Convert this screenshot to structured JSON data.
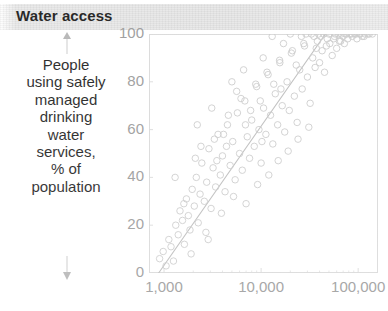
{
  "header": {
    "title": "Water access",
    "band_color": "#e8e8e8"
  },
  "axis_caption": {
    "lines": [
      "People",
      "using safely",
      "managed",
      "drinking",
      "water",
      "services,",
      "% of",
      "population"
    ],
    "arrow_up": "arrow-up-icon",
    "arrow_down": "arrow-down-icon"
  },
  "chart_data": {
    "type": "scatter",
    "title": "Water access",
    "xlabel": "",
    "ylabel": "People using safely managed drinking water services, % of population",
    "x_scale": "log",
    "xlim": [
      700,
      160000
    ],
    "ylim": [
      0,
      100
    ],
    "grid": false,
    "legend": null,
    "xticks": [
      1000,
      10000,
      100000
    ],
    "xtick_labels": [
      "1,000",
      "10,000",
      "100,000"
    ],
    "yticks": [
      0,
      20,
      40,
      60,
      80,
      100
    ],
    "ytick_labels": [
      "0",
      "20",
      "40",
      "60",
      "80",
      "100"
    ],
    "marker": {
      "shape": "circle",
      "fill": "none",
      "edge_color": "#c9c9c9",
      "size": 6.5
    },
    "trendline": {
      "type": "linear-on-log-x",
      "color": "#bdbdbd",
      "x0": 880,
      "y0": 0,
      "x1": 46000,
      "y1": 100
    },
    "points": [
      [
        900,
        6
      ],
      [
        980,
        9
      ],
      [
        1050,
        3
      ],
      [
        1120,
        14
      ],
      [
        1180,
        11
      ],
      [
        1250,
        5
      ],
      [
        1320,
        20
      ],
      [
        1400,
        16
      ],
      [
        1460,
        26
      ],
      [
        1550,
        22
      ],
      [
        1620,
        12
      ],
      [
        1700,
        31
      ],
      [
        1780,
        24
      ],
      [
        1850,
        18
      ],
      [
        1950,
        35
      ],
      [
        2050,
        28
      ],
      [
        2150,
        40
      ],
      [
        2250,
        21
      ],
      [
        2350,
        33
      ],
      [
        2450,
        46
      ],
      [
        2600,
        30
      ],
      [
        2750,
        38
      ],
      [
        2900,
        52
      ],
      [
        3050,
        27
      ],
      [
        3200,
        44
      ],
      [
        3400,
        36
      ],
      [
        3600,
        58
      ],
      [
        3800,
        41
      ],
      [
        4000,
        49
      ],
      [
        4250,
        34
      ],
      [
        4500,
        62
      ],
      [
        4800,
        45
      ],
      [
        5100,
        55
      ],
      [
        5400,
        39
      ],
      [
        5700,
        67
      ],
      [
        6000,
        50
      ],
      [
        6400,
        43
      ],
      [
        6800,
        72
      ],
      [
        7200,
        57
      ],
      [
        7600,
        48
      ],
      [
        8000,
        64
      ],
      [
        8500,
        53
      ],
      [
        9000,
        78
      ],
      [
        9500,
        60
      ],
      [
        10000,
        46
      ],
      [
        10600,
        69
      ],
      [
        11200,
        58
      ],
      [
        11800,
        83
      ],
      [
        12500,
        66
      ],
      [
        13200,
        54
      ],
      [
        14000,
        75
      ],
      [
        14800,
        62
      ],
      [
        15600,
        88
      ],
      [
        16500,
        70
      ],
      [
        17500,
        59
      ],
      [
        18500,
        80
      ],
      [
        19500,
        68
      ],
      [
        20500,
        92
      ],
      [
        22000,
        74
      ],
      [
        23500,
        63
      ],
      [
        25000,
        85
      ],
      [
        26500,
        77
      ],
      [
        28000,
        95
      ],
      [
        30000,
        82
      ],
      [
        32000,
        71
      ],
      [
        34000,
        90
      ],
      [
        36000,
        86
      ],
      [
        38000,
        97
      ],
      [
        40000,
        88
      ],
      [
        42500,
        93
      ],
      [
        45000,
        84
      ],
      [
        48000,
        98
      ],
      [
        51000,
        96
      ],
      [
        54000,
        91
      ],
      [
        57000,
        99
      ],
      [
        60000,
        94
      ],
      [
        63000,
        100
      ],
      [
        66000,
        97
      ],
      [
        70000,
        99
      ],
      [
        74000,
        100
      ],
      [
        78000,
        98
      ],
      [
        82000,
        100
      ],
      [
        87000,
        99
      ],
      [
        92000,
        100
      ],
      [
        97000,
        98
      ],
      [
        103000,
        100
      ],
      [
        110000,
        99
      ],
      [
        118000,
        100
      ],
      [
        126000,
        100
      ],
      [
        1900,
        8
      ],
      [
        2700,
        17
      ],
      [
        3900,
        25
      ],
      [
        5200,
        32
      ],
      [
        7000,
        29
      ],
      [
        9200,
        37
      ],
      [
        12000,
        41
      ],
      [
        15000,
        47
      ],
      [
        19000,
        51
      ],
      [
        24000,
        56
      ],
      [
        31000,
        61
      ],
      [
        1300,
        40
      ],
      [
        2100,
        48
      ],
      [
        3300,
        56
      ],
      [
        4600,
        66
      ],
      [
        6200,
        73
      ],
      [
        8800,
        79
      ],
      [
        11500,
        84
      ],
      [
        15500,
        89
      ],
      [
        21000,
        93
      ],
      [
        27500,
        96
      ],
      [
        35000,
        99
      ],
      [
        2200,
        62
      ],
      [
        3100,
        69
      ],
      [
        4100,
        58
      ],
      [
        5600,
        76
      ],
      [
        7800,
        68
      ],
      [
        10500,
        90
      ],
      [
        13500,
        79
      ],
      [
        17000,
        96
      ],
      [
        23000,
        87
      ],
      [
        29000,
        100
      ],
      [
        39000,
        100
      ],
      [
        1600,
        29
      ],
      [
        2400,
        53
      ],
      [
        3500,
        47
      ],
      [
        5000,
        80
      ],
      [
        6600,
        85
      ],
      [
        9800,
        72
      ],
      [
        13000,
        99
      ],
      [
        16000,
        77
      ],
      [
        20000,
        100
      ],
      [
        26000,
        99
      ],
      [
        33000,
        100
      ],
      [
        44000,
        100
      ],
      [
        50000,
        100
      ],
      [
        58000,
        100
      ],
      [
        67000,
        100
      ],
      [
        76000,
        100
      ],
      [
        85000,
        100
      ],
      [
        95000,
        100
      ],
      [
        105000,
        100
      ],
      [
        115000,
        99
      ],
      [
        130000,
        100
      ],
      [
        140000,
        100
      ],
      [
        72000,
        96
      ],
      [
        64000,
        97
      ],
      [
        56000,
        98
      ],
      [
        47000,
        95
      ],
      [
        41000,
        99
      ],
      [
        37000,
        94
      ],
      [
        2850,
        14
      ],
      [
        4400,
        53
      ],
      [
        6900,
        62
      ],
      [
        10200,
        55
      ]
    ]
  }
}
